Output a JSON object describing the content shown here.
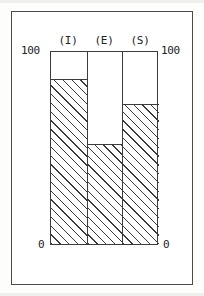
{
  "figure": {
    "name": "stacked-proportion-bar-figure",
    "frame_color": "#4a4a4a",
    "background": "#ffffff"
  },
  "axis": {
    "top_left_label": "100",
    "top_right_label": "100",
    "bottom_left_label": "0",
    "bottom_right_label": "0"
  },
  "chart_data": {
    "type": "bar",
    "title": "",
    "subtitle": "",
    "xlabel": "",
    "ylabel": "",
    "categories": [
      "(I)",
      "(E)",
      "(S)"
    ],
    "values": [
      86,
      52,
      73
    ],
    "ylim": [
      0,
      100
    ],
    "tick_labels_y": [
      "0",
      "100"
    ],
    "grid": false,
    "legend": null,
    "legend_position": "none",
    "annotations": [],
    "style": {
      "fill": "diagonal-hatch",
      "hatch_direction": "forward-slash",
      "bar_gap": 0,
      "outline_color": "#3c3c3c"
    }
  }
}
